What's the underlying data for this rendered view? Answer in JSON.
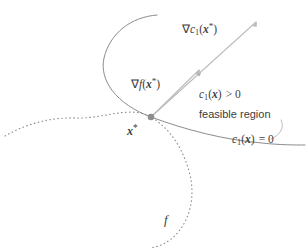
{
  "figure": {
    "background_color": "#ffffff",
    "width": 307,
    "height": 252
  },
  "labels": {
    "grad_c1": {
      "nabla": "∇",
      "fn": "c",
      "subscript": "1",
      "open": "(",
      "variable": "x",
      "star": "*",
      "close": ")"
    },
    "grad_f": {
      "nabla": "∇",
      "fn": "f",
      "open": "(",
      "variable": "x",
      "star": "*",
      "close": ")"
    },
    "c1_positive": {
      "fn": "c",
      "subscript": "1",
      "open": "(",
      "variable": "x",
      "close": ")",
      "relation": "> 0"
    },
    "feasible_region": "feasible region",
    "c1_zero": {
      "fn": "c",
      "subscript": "1",
      "open": "(",
      "variable": "x",
      "close": ")",
      "relation": "= 0"
    },
    "x_star": {
      "variable": "x",
      "star": "*"
    },
    "objective_curve": "f"
  },
  "colors": {
    "constraint_curve": "#8c8c8c",
    "contour_curve": "#8a8a8a",
    "gradient_arrow": "#b4b4b4",
    "point_marker": "#8e8e8e",
    "leader_line": "#b0b0b0",
    "text": "#3d3d3d"
  },
  "geometry": {
    "solution_point": {
      "x": 151,
      "y": 117
    },
    "gradient_c1_tip": {
      "x": 256,
      "y": 22
    },
    "gradient_f_tip": {
      "x": 199,
      "y": 70
    },
    "constraint_curve_label_anchor": {
      "x": 232,
      "y": 140
    },
    "contour_curve_label_anchor": {
      "x": 166,
      "y": 218
    }
  }
}
